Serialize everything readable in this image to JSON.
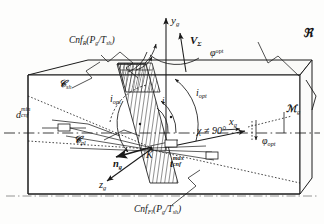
{
  "figure": {
    "background_color": "#fdfdfc",
    "line_color": "#1a1a1a",
    "hatch_color": "#2a2a2a"
  },
  "labels": {
    "cnf_top": {
      "head": "Cnf",
      "head_sub": "R",
      "args": "(P",
      "args_sub": "g",
      "args_mid": "/T",
      "args_sub2": "sh",
      "args_end": ")"
    },
    "cnf_bottom": {
      "head": "Cnf",
      "head_sub": "Fl",
      "args": "(P",
      "args_sub": "g",
      "args_mid": "/T",
      "args_sub2": "sh",
      "args_end": ")"
    },
    "y_axis": {
      "base": "y",
      "sub": "g"
    },
    "x_axis": {
      "base": "x",
      "sub": "g"
    },
    "z_axis": {
      "base": "z",
      "sub": "g"
    },
    "v_sigma": {
      "base": "V",
      "sub": "Σ"
    },
    "phi_sup_opt": {
      "base": "φ",
      "sup": "opt"
    },
    "phi_sub_opt": {
      "base": "φ",
      "sub": "opt"
    },
    "i_opt_left": {
      "base": "i",
      "sub": "opt"
    },
    "i_opt_right": {
      "base": "i",
      "sub": "opt"
    },
    "d_cnf_min": {
      "base": "d",
      "sup": "min",
      "sub": "cnf"
    },
    "t_cnf_max": {
      "base": "t",
      "sup": "max",
      "sub": "cnf"
    },
    "c_sh": {
      "base": "𝒞",
      "sub": "sh"
    },
    "c_pl": {
      "base": "𝒞",
      "sub": "pl"
    },
    "n_g": {
      "base": "n",
      "sub": "g"
    },
    "point_k": {
      "base": "K"
    },
    "chi_angle": {
      "base": "χ ≠ 90°"
    },
    "frak_r": {
      "base": "ℜ"
    },
    "m_g": {
      "base": "ℳ",
      "sub": "g"
    },
    "i_angle": {
      "base": "i"
    }
  }
}
